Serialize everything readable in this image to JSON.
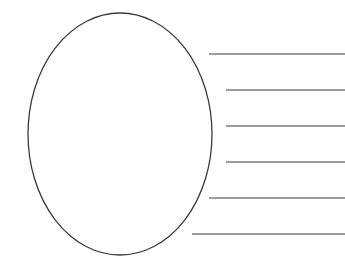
{
  "diagram": {
    "type": "graphic-organizer",
    "stroke_color": "#3a3a3a",
    "ellipse": {
      "cx": 120,
      "cy": 134,
      "rx": 92,
      "ry": 121
    },
    "lines": [
      {
        "x1": 209,
        "y": 54,
        "x2": 345
      },
      {
        "x1": 226,
        "y": 90,
        "x2": 345
      },
      {
        "x1": 226,
        "y": 126,
        "x2": 345
      },
      {
        "x1": 226,
        "y": 162,
        "x2": 345
      },
      {
        "x1": 209,
        "y": 198,
        "x2": 345
      },
      {
        "x1": 192,
        "y": 234,
        "x2": 345
      }
    ]
  }
}
